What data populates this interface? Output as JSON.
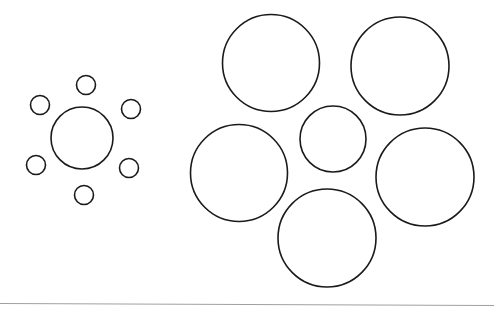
{
  "diagram": {
    "title": "",
    "stroke_color": "#1a1a1a",
    "divider_color": "#a0a0a0",
    "groups": [
      {
        "name": "small-surround-group",
        "center": {
          "cx": 82,
          "cy": 138,
          "r": 31
        },
        "surround": [
          {
            "cx": 86,
            "cy": 85,
            "r": 9.5
          },
          {
            "cx": 40,
            "cy": 105,
            "r": 9.5
          },
          {
            "cx": 131,
            "cy": 109,
            "r": 9.5
          },
          {
            "cx": 36,
            "cy": 165,
            "r": 9.5
          },
          {
            "cx": 129,
            "cy": 168,
            "r": 9.5
          },
          {
            "cx": 84,
            "cy": 195,
            "r": 9.5
          }
        ]
      },
      {
        "name": "large-surround-group",
        "center": {
          "cx": 333,
          "cy": 139,
          "r": 33
        },
        "surround": [
          {
            "cx": 271,
            "cy": 63,
            "r": 48.5
          },
          {
            "cx": 400,
            "cy": 66,
            "r": 49
          },
          {
            "cx": 239,
            "cy": 173,
            "r": 48.5
          },
          {
            "cx": 425,
            "cy": 177,
            "r": 49
          },
          {
            "cx": 327,
            "cy": 238,
            "r": 49
          }
        ]
      }
    ],
    "divider": {
      "x1": 0,
      "y1": 303.5,
      "x2": 494,
      "y2": 305.5
    }
  }
}
